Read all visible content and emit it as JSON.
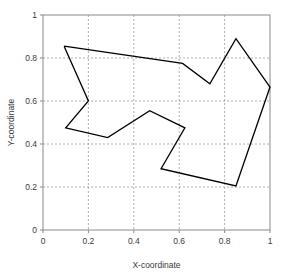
{
  "chart_data": {
    "type": "line",
    "title": "",
    "subtitle": "",
    "xlabel": "X-coordinate",
    "ylabel": "Y-coordinate",
    "xlim": [
      0,
      1
    ],
    "ylim": [
      0,
      1
    ],
    "xticks": [
      "0",
      "0.2",
      "0.4",
      "0.6",
      "0.8",
      "1"
    ],
    "xtick_values": [
      0,
      0.2,
      0.4,
      0.6,
      0.8,
      1
    ],
    "yticks": [
      "0",
      "0.2",
      "0.4",
      "0.6",
      "0.8",
      "1"
    ],
    "ytick_values": [
      0,
      0.2,
      0.4,
      0.6,
      0.8,
      1
    ],
    "grid": true,
    "grid_style": "dashed",
    "legend": null,
    "legend_position": "none",
    "closed_polygon": true,
    "line_color": "#000000",
    "grid_color": "#999999",
    "axis_color": "#8a8a8a",
    "background_color": "#ffffff",
    "series": [
      {
        "name": "polygon-outline",
        "closed": true,
        "points": [
          [
            0.093,
            0.855
          ],
          [
            0.2,
            0.6
          ],
          [
            0.1,
            0.475
          ],
          [
            0.285,
            0.43
          ],
          [
            0.47,
            0.555
          ],
          [
            0.625,
            0.475
          ],
          [
            0.52,
            0.285
          ],
          [
            0.85,
            0.205
          ],
          [
            1.0,
            0.665
          ],
          [
            0.85,
            0.89
          ],
          [
            0.735,
            0.68
          ],
          [
            0.615,
            0.775
          ],
          [
            0.093,
            0.855
          ]
        ]
      }
    ]
  },
  "axes": {
    "x_axis_label": "X-coordinate",
    "y_axis_label": "Y-coordinate"
  }
}
